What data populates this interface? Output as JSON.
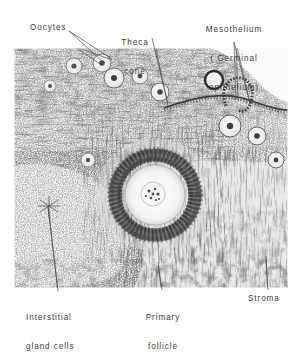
{
  "figure": {
    "type": "histology-micrograph",
    "background_color": "#ffffff",
    "ink_color": "#3b3b3b",
    "micrograph": {
      "x": 14,
      "y": 48,
      "width": 274,
      "height": 240,
      "tone": "black-and-white",
      "description": "Photomicrograph of ovarian cortex"
    }
  },
  "labels": {
    "oocytes": {
      "text": "Oocytes",
      "x": 30,
      "y": 24
    },
    "theca_cone": {
      "line1": "Theca",
      "line2": "cone",
      "x": 114,
      "y": 19
    },
    "mesothelium": {
      "line1": "Mesothelium",
      "line2": "( Germinal",
      "line3": "epithelium)",
      "x": 193,
      "y": 6
    },
    "interstitial": {
      "line1": "Interstitial",
      "line2": "gland cells",
      "x": 26,
      "y": 297
    },
    "primary_follicle": {
      "line1": "Primary",
      "line2": "follicle",
      "x": 143,
      "y": 297
    },
    "stroma": {
      "text": "Stroma",
      "x": 248,
      "y": 297
    }
  }
}
